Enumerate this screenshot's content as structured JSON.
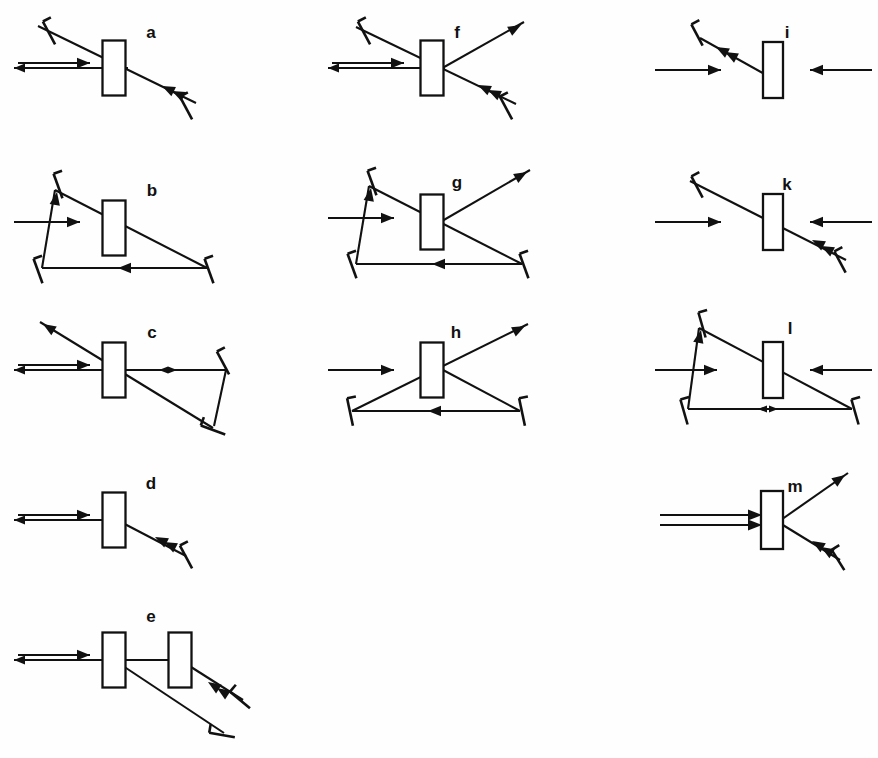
{
  "figure": {
    "background_color": "#fefefe",
    "ink_color": "#111111",
    "width": 878,
    "height": 758,
    "panel_count": 13,
    "labels": [
      "a",
      "b",
      "c",
      "d",
      "e",
      "f",
      "g",
      "h",
      "i",
      "k",
      "l",
      "m"
    ]
  },
  "legend": {
    "crystal_label": "crystal-block",
    "mirror_label": "mirror",
    "beam_label": "beam-ray",
    "note": "Each panel shows a nonlinear crystal block with beam paths and end mirrors."
  },
  "panels": [
    {
      "id": "a",
      "label": "a",
      "label_x": 151,
      "label_y": 38,
      "x": 0,
      "y": 0,
      "w": 300,
      "h": 150,
      "description": "Standing-wave double pass: horizontal in/out pair through crystal, diagonal path to two tilted mirrors",
      "crystals": [
        {
          "cx": 114,
          "cy": 68,
          "w": 23,
          "h": 55,
          "angle": 0
        }
      ],
      "mirrors": [
        {
          "x": 49,
          "y": 33,
          "angle": 62,
          "len": 26
        },
        {
          "x": 186,
          "y": 108,
          "angle": 62,
          "len": 26
        }
      ],
      "rays": [
        {
          "type": "line",
          "x1": 38,
          "y1": 26,
          "x2": 196,
          "y2": 103
        },
        {
          "type": "line",
          "x1": 20,
          "y1": 68,
          "x2": 128,
          "y2": 68
        }
      ],
      "arrows": [
        {
          "type": "double-beam",
          "x": 18,
          "y": 68,
          "len": 72,
          "dir": "right"
        },
        {
          "type": "head",
          "x": 162,
          "y": 86,
          "angle": 206
        },
        {
          "type": "head",
          "x": 172,
          "y": 91,
          "angle": 206
        }
      ]
    },
    {
      "id": "b",
      "label": "b",
      "label_x": 152,
      "label_y": 196,
      "x": 0,
      "y": 150,
      "w": 300,
      "h": 150,
      "description": "Triangular ring cavity: input from left, three mirrors, crystal in upper leg",
      "crystals": [
        {
          "cx": 114,
          "cy": 228,
          "w": 23,
          "h": 55,
          "angle": 0
        }
      ],
      "mirrors": [
        {
          "x": 58,
          "y": 186,
          "angle": 70,
          "len": 26
        },
        {
          "x": 38,
          "y": 271,
          "angle": 70,
          "len": 26
        },
        {
          "x": 209,
          "y": 271,
          "angle": 70,
          "len": 26
        }
      ],
      "rays": [
        {
          "type": "line",
          "x1": 55,
          "y1": 190,
          "x2": 207,
          "y2": 268
        },
        {
          "type": "line",
          "x1": 42,
          "y1": 268,
          "x2": 207,
          "y2": 268
        },
        {
          "type": "line",
          "x1": 42,
          "y1": 268,
          "x2": 55,
          "y2": 190
        }
      ],
      "arrows": [
        {
          "type": "single",
          "x": 14,
          "y": 222,
          "len": 66,
          "dir": "right"
        },
        {
          "type": "head",
          "x": 57,
          "y": 192,
          "angle": 280
        },
        {
          "type": "head",
          "x": 118,
          "y": 268,
          "angle": 180
        }
      ]
    },
    {
      "id": "c",
      "label": "c",
      "label_x": 152,
      "label_y": 338,
      "x": 0,
      "y": 300,
      "w": 300,
      "h": 155,
      "description": "Folded cavity: horizontal in/out pair plus diagonal output, two mirrors at right forming a fold",
      "crystals": [
        {
          "cx": 114,
          "cy": 370,
          "w": 23,
          "h": 55,
          "angle": 0
        }
      ],
      "mirrors": [
        {
          "x": 223,
          "y": 363,
          "angle": 62,
          "len": 26
        },
        {
          "x": 213,
          "y": 430,
          "angle": 20,
          "len": 26
        }
      ],
      "rays": [
        {
          "type": "line",
          "x1": 40,
          "y1": 322,
          "x2": 213,
          "y2": 428
        },
        {
          "type": "line",
          "x1": 20,
          "y1": 370,
          "x2": 226,
          "y2": 370
        },
        {
          "type": "line",
          "x1": 226,
          "y1": 370,
          "x2": 214,
          "y2": 426
        }
      ],
      "arrows": [
        {
          "type": "double-beam",
          "x": 18,
          "y": 370,
          "len": 72,
          "dir": "right"
        },
        {
          "type": "head",
          "x": 43,
          "y": 324,
          "angle": 212
        },
        {
          "type": "bidirectional",
          "x": 168,
          "y": 370,
          "len": 18
        }
      ]
    },
    {
      "id": "d",
      "label": "d",
      "label_x": 151,
      "label_y": 489,
      "x": 0,
      "y": 455,
      "w": 300,
      "h": 135,
      "description": "Simple single-mirror arm: horizontal in/out pair into crystal, one tilted mirror on lower-right diagonal",
      "crystals": [
        {
          "cx": 114,
          "cy": 520,
          "w": 23,
          "h": 55,
          "angle": 0
        }
      ],
      "mirrors": [
        {
          "x": 186,
          "y": 557,
          "angle": 62,
          "len": 26
        }
      ],
      "rays": [
        {
          "type": "line",
          "x1": 20,
          "y1": 520,
          "x2": 117,
          "y2": 520
        },
        {
          "type": "line",
          "x1": 117,
          "y1": 520,
          "x2": 186,
          "y2": 556
        }
      ],
      "arrows": [
        {
          "type": "double-beam",
          "x": 18,
          "y": 520,
          "len": 72,
          "dir": "right"
        },
        {
          "type": "head",
          "x": 155,
          "y": 537,
          "angle": 207
        },
        {
          "type": "head",
          "x": 164,
          "y": 542,
          "angle": 207
        }
      ]
    },
    {
      "id": "e",
      "label": "e",
      "label_x": 151,
      "label_y": 622,
      "x": 0,
      "y": 590,
      "w": 310,
      "h": 168,
      "description": "Two crystals in series with folded return path via two tilted mirrors at lower right",
      "crystals": [
        {
          "cx": 114,
          "cy": 660,
          "w": 23,
          "h": 55,
          "angle": 0
        },
        {
          "cx": 180,
          "cy": 660,
          "w": 23,
          "h": 55,
          "angle": 0
        }
      ],
      "mirrors": [
        {
          "x": 240,
          "y": 700,
          "angle": 40,
          "len": 26
        },
        {
          "x": 222,
          "y": 735,
          "angle": 10,
          "len": 26
        }
      ],
      "rays": [
        {
          "type": "line",
          "x1": 18,
          "y1": 660,
          "x2": 180,
          "y2": 660
        },
        {
          "type": "line",
          "x1": 180,
          "y1": 660,
          "x2": 243,
          "y2": 700
        },
        {
          "type": "line",
          "x1": 114,
          "y1": 660,
          "x2": 224,
          "y2": 733
        }
      ],
      "arrows": [
        {
          "type": "double-beam",
          "x": 18,
          "y": 660,
          "len": 72,
          "dir": "right"
        },
        {
          "type": "head",
          "x": 208,
          "y": 682,
          "angle": 213
        },
        {
          "type": "head",
          "x": 217,
          "y": 688,
          "angle": 213
        }
      ]
    },
    {
      "id": "f",
      "label": "f",
      "label_x": 457,
      "label_y": 38,
      "x": 300,
      "y": 0,
      "w": 290,
      "h": 150,
      "description": "Same as a with additional output beam exiting to the upper right from the crystal",
      "crystals": [
        {
          "cx": 432,
          "cy": 68,
          "w": 23,
          "h": 55,
          "angle": 0
        }
      ],
      "mirrors": [
        {
          "x": 364,
          "y": 33,
          "angle": 62,
          "len": 26
        },
        {
          "x": 506,
          "y": 108,
          "angle": 62,
          "len": 26
        }
      ],
      "rays": [
        {
          "type": "line",
          "x1": 356,
          "y1": 27,
          "x2": 516,
          "y2": 104
        },
        {
          "type": "line",
          "x1": 334,
          "y1": 68,
          "x2": 445,
          "y2": 68
        },
        {
          "type": "line",
          "x1": 430,
          "y1": 75,
          "x2": 524,
          "y2": 22
        }
      ],
      "arrows": [
        {
          "type": "double-beam",
          "x": 332,
          "y": 68,
          "len": 72,
          "dir": "right"
        },
        {
          "type": "head",
          "x": 521,
          "y": 25,
          "angle": 331
        },
        {
          "type": "head",
          "x": 478,
          "y": 85,
          "angle": 206
        },
        {
          "type": "head",
          "x": 488,
          "y": 90,
          "angle": 206
        }
      ]
    },
    {
      "id": "g",
      "label": "g",
      "label_x": 457,
      "label_y": 188,
      "x": 300,
      "y": 150,
      "w": 290,
      "h": 150,
      "description": "Ring cavity as b with an extra output beam leaving the crystal toward upper right",
      "crystals": [
        {
          "cx": 432,
          "cy": 222,
          "w": 23,
          "h": 55,
          "angle": 0
        }
      ],
      "mirrors": [
        {
          "x": 372,
          "y": 183,
          "angle": 70,
          "len": 26
        },
        {
          "x": 352,
          "y": 266,
          "angle": 70,
          "len": 26
        },
        {
          "x": 524,
          "y": 266,
          "angle": 70,
          "len": 26
        }
      ],
      "rays": [
        {
          "type": "line",
          "x1": 369,
          "y1": 186,
          "x2": 522,
          "y2": 264
        },
        {
          "type": "line",
          "x1": 356,
          "y1": 264,
          "x2": 522,
          "y2": 264
        },
        {
          "type": "line",
          "x1": 356,
          "y1": 264,
          "x2": 369,
          "y2": 186
        },
        {
          "type": "line",
          "x1": 430,
          "y1": 228,
          "x2": 530,
          "y2": 170
        }
      ],
      "arrows": [
        {
          "type": "single",
          "x": 328,
          "y": 218,
          "len": 66,
          "dir": "right"
        },
        {
          "type": "head",
          "x": 371,
          "y": 188,
          "angle": 280
        },
        {
          "type": "head",
          "x": 432,
          "y": 264,
          "angle": 180
        },
        {
          "type": "head",
          "x": 527,
          "y": 172,
          "angle": 330
        }
      ]
    },
    {
      "id": "h",
      "label": "h",
      "label_x": 456,
      "label_y": 338,
      "x": 300,
      "y": 300,
      "w": 290,
      "h": 150,
      "description": "Triangular ring with two bottom mirrors, crystal at apex, output beam to upper right",
      "crystals": [
        {
          "cx": 432,
          "cy": 370,
          "w": 23,
          "h": 55,
          "angle": 0
        }
      ],
      "mirrors": [
        {
          "x": 350,
          "y": 412,
          "angle": 78,
          "len": 28
        },
        {
          "x": 522,
          "y": 412,
          "angle": 78,
          "len": 28
        }
      ],
      "rays": [
        {
          "type": "line",
          "x1": 352,
          "y1": 411,
          "x2": 520,
          "y2": 411
        },
        {
          "type": "line",
          "x1": 352,
          "y1": 411,
          "x2": 528,
          "y2": 324
        },
        {
          "type": "line",
          "x1": 520,
          "y1": 411,
          "x2": 428,
          "y2": 362
        }
      ],
      "arrows": [
        {
          "type": "single",
          "x": 328,
          "y": 370,
          "len": 66,
          "dir": "right"
        },
        {
          "type": "head",
          "x": 525,
          "y": 326,
          "angle": 333
        },
        {
          "type": "head",
          "x": 428,
          "y": 411,
          "angle": 180
        }
      ]
    },
    {
      "id": "i",
      "label": "i",
      "label_x": 787,
      "label_y": 38,
      "x": 640,
      "y": 0,
      "w": 238,
      "h": 150,
      "description": "Counter-propagating beams onto crystal with single mirror arm toward upper left",
      "crystals": [
        {
          "cx": 773,
          "cy": 70,
          "w": 20,
          "h": 56,
          "angle": 0
        }
      ],
      "mirrors": [
        {
          "x": 697,
          "y": 35,
          "angle": 62,
          "len": 24
        }
      ],
      "rays": [
        {
          "type": "line",
          "x1": 700,
          "y1": 38,
          "x2": 768,
          "y2": 76
        }
      ],
      "arrows": [
        {
          "type": "single",
          "x": 655,
          "y": 70,
          "len": 66,
          "dir": "right"
        },
        {
          "type": "single",
          "x": 872,
          "y": 70,
          "len": 62,
          "dir": "left"
        },
        {
          "type": "head",
          "x": 716,
          "y": 47,
          "angle": 208
        },
        {
          "type": "head",
          "x": 725,
          "y": 52,
          "angle": 208
        }
      ]
    },
    {
      "id": "k",
      "label": "k",
      "label_x": 787,
      "label_y": 190,
      "x": 640,
      "y": 150,
      "w": 238,
      "h": 150,
      "description": "Counter-propagating beams with a long diagonal through the crystal to mirrors at both ends",
      "crystals": [
        {
          "cx": 773,
          "cy": 222,
          "w": 20,
          "h": 56,
          "angle": 0
        }
      ],
      "mirrors": [
        {
          "x": 697,
          "y": 187,
          "angle": 62,
          "len": 24
        },
        {
          "x": 840,
          "y": 262,
          "angle": 62,
          "len": 24
        }
      ],
      "rays": [
        {
          "type": "line",
          "x1": 690,
          "y1": 181,
          "x2": 846,
          "y2": 260
        }
      ],
      "arrows": [
        {
          "type": "single",
          "x": 655,
          "y": 222,
          "len": 66,
          "dir": "right"
        },
        {
          "type": "single",
          "x": 872,
          "y": 222,
          "len": 62,
          "dir": "left"
        },
        {
          "type": "head",
          "x": 812,
          "y": 240,
          "angle": 207
        },
        {
          "type": "head",
          "x": 821,
          "y": 246,
          "angle": 207
        }
      ]
    },
    {
      "id": "l",
      "label": "l",
      "label_x": 790,
      "label_y": 334,
      "x": 640,
      "y": 300,
      "w": 238,
      "h": 150,
      "description": "Ring cavity fed from both sides, bidirectional marker on the bottom leg",
      "crystals": [
        {
          "cx": 773,
          "cy": 370,
          "w": 20,
          "h": 56,
          "angle": 0
        }
      ],
      "mirrors": [
        {
          "x": 702,
          "y": 325,
          "angle": 74,
          "len": 26
        },
        {
          "x": 684,
          "y": 412,
          "angle": 74,
          "len": 26
        },
        {
          "x": 855,
          "y": 412,
          "angle": 74,
          "len": 26
        }
      ],
      "rays": [
        {
          "type": "line",
          "x1": 699,
          "y1": 328,
          "x2": 852,
          "y2": 409
        },
        {
          "type": "line",
          "x1": 688,
          "y1": 409,
          "x2": 852,
          "y2": 409
        },
        {
          "type": "line",
          "x1": 688,
          "y1": 409,
          "x2": 699,
          "y2": 328
        }
      ],
      "arrows": [
        {
          "type": "single",
          "x": 655,
          "y": 370,
          "len": 62,
          "dir": "right"
        },
        {
          "type": "single",
          "x": 872,
          "y": 370,
          "len": 62,
          "dir": "left"
        },
        {
          "type": "head",
          "x": 701,
          "y": 330,
          "angle": 282
        },
        {
          "type": "bidirectional",
          "x": 768,
          "y": 409,
          "len": 20
        }
      ]
    },
    {
      "id": "m",
      "label": "m",
      "label_x": 795,
      "label_y": 492,
      "x": 640,
      "y": 455,
      "w": 238,
      "h": 150,
      "description": "Wide double-line input onto crystal, V-shaped split into upward output and downward mirror arm",
      "crystals": [
        {
          "cx": 772,
          "cy": 520,
          "w": 22,
          "h": 58,
          "angle": 0
        }
      ],
      "mirrors": [
        {
          "x": 838,
          "y": 560,
          "angle": 58,
          "len": 24
        }
      ],
      "rays": [
        {
          "type": "line",
          "x1": 778,
          "y1": 522,
          "x2": 848,
          "y2": 473
        },
        {
          "type": "line",
          "x1": 778,
          "y1": 522,
          "x2": 840,
          "y2": 560
        }
      ],
      "arrows": [
        {
          "type": "wide-double",
          "x": 660,
          "y": 520,
          "len": 92,
          "dir": "right"
        },
        {
          "type": "head",
          "x": 845,
          "y": 475,
          "angle": 325
        },
        {
          "type": "head",
          "x": 812,
          "y": 541,
          "angle": 211
        },
        {
          "type": "head",
          "x": 821,
          "y": 547,
          "angle": 211
        }
      ]
    }
  ]
}
